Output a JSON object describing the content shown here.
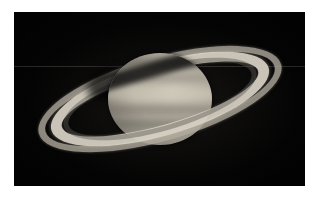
{
  "image": {
    "subject": "Saturn",
    "kind": "astrophotograph",
    "alt_text": "Telescopic photograph of the planet Saturn with its ring system tilted, shown against a black sky",
    "canvas": {
      "width": 316,
      "height": 199
    },
    "mat": {
      "color": "#ffffff"
    },
    "frame": {
      "color": "#010101",
      "left": 14,
      "top": 12,
      "width": 291,
      "height": 174
    }
  },
  "scene": {
    "sky_color": "#030303",
    "ring_tilt_degrees": -16,
    "artifact_label": "horizontal readout seam",
    "planet": {
      "name": "Saturn",
      "globe_color": "#b2ac9f",
      "highlight_color": "#c6c0b2",
      "limb_color": "#282623",
      "belts": [
        {
          "name": "north-polar-hood",
          "tone": "#605c55"
        },
        {
          "name": "north-temperate-belt",
          "tone": "#78746b"
        },
        {
          "name": "equatorial-zone",
          "tone": "#e0dacb"
        },
        {
          "name": "south-equatorial-belt",
          "tone": "#68645c"
        },
        {
          "name": "south-temperate-belt",
          "tone": "#58554e"
        }
      ]
    },
    "rings": [
      {
        "name": "A-ring",
        "tone": "#b0aa9e",
        "note": "outer ring"
      },
      {
        "name": "cassini-division",
        "tone": "#050505",
        "note": "dark gap between A and B rings"
      },
      {
        "name": "B-ring",
        "tone": "#d6d0c2",
        "note": "brightest ring"
      },
      {
        "name": "C-ring",
        "tone": "#5c5953",
        "note": "faint crepe ring"
      }
    ],
    "shadows": [
      {
        "name": "ring-shadow-on-globe"
      },
      {
        "name": "globe-shadow-on-rings"
      }
    ]
  }
}
